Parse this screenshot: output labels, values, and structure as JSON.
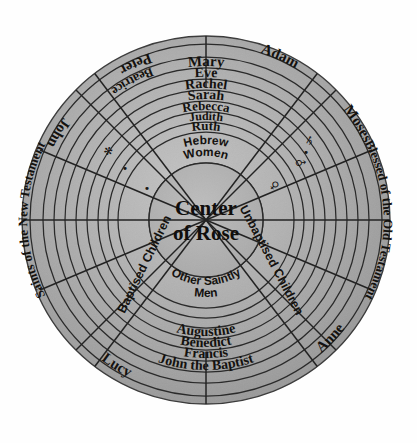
{
  "diagram": {
    "title": "Center of Rose",
    "center_label_lines": [
      "Center",
      "of Rose"
    ],
    "colors": {
      "background": "#fefefe",
      "paper_light": "#b9b9b9",
      "paper_mid": "#a6a6a6",
      "paper_dark": "#969696",
      "ink": "#14120f",
      "line": "#2a2a2a"
    },
    "top_rings": [
      {
        "label": "Mary"
      },
      {
        "label": "Eve"
      },
      {
        "label": "Rachel"
      },
      {
        "label": "Sarah"
      },
      {
        "label": "Rebecca"
      },
      {
        "label": "Judith"
      },
      {
        "label": "Ruth"
      }
    ],
    "inner_top_label_lines": [
      "Hebrew",
      "Women"
    ],
    "inner_bottom_label_lines": [
      "Other Saintly",
      "Men"
    ],
    "inner_left_label": "Baptised Children",
    "inner_right_label": "Unbaptised Children",
    "bottom_rings": [
      {
        "label": "Augustine"
      },
      {
        "label": "Benedict"
      },
      {
        "label": "Francis"
      },
      {
        "label": "John the Baptist"
      }
    ],
    "upper_left_names": [
      {
        "label": "Peter"
      },
      {
        "label": "John"
      },
      {
        "label": "Beatrice"
      }
    ],
    "upper_right_names": [
      {
        "label": "Adam"
      },
      {
        "label": "Moses"
      }
    ],
    "lower_left_names": [
      {
        "label": "Lucy"
      }
    ],
    "lower_right_names": [
      {
        "label": "Anne"
      }
    ],
    "side_labels": {
      "left": "Saints of the New Testament",
      "right": "Blessed of the Old Testament"
    },
    "glyphs": [
      {
        "name": "saturn-symbol",
        "char": "♄"
      },
      {
        "name": "mars-symbol",
        "char": "♂"
      },
      {
        "name": "venus-symbol",
        "char": "♀"
      },
      {
        "name": "asterisk-mark",
        "char": "✻"
      },
      {
        "name": "dot-mark",
        "char": "•"
      }
    ]
  }
}
